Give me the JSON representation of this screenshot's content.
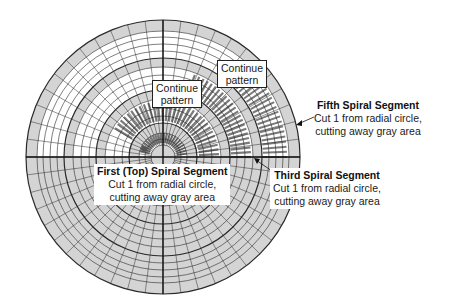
{
  "figure": {
    "type": "spiral-segment cutting layout on radial circle grid",
    "colors": {
      "gray_area": "#d4d4d4",
      "grid_line": "#2a2a2a",
      "strip_mark": "#7a7a7a",
      "background": "#ffffff"
    }
  },
  "callouts": [
    {
      "id": "continue-1",
      "text_line1": "Continue",
      "text_line2": "pattern"
    },
    {
      "id": "continue-2",
      "text_line1": "Continue",
      "text_line2": "pattern"
    }
  ],
  "labels": {
    "fifth": {
      "title": "Fifth Spiral Segment",
      "line1": "Cut 1 from radial circle,",
      "line2": "cutting away gray area"
    },
    "first": {
      "title": "First (Top) Spiral Segment",
      "line1": "Cut 1 from radial circle,",
      "line2": "cutting away gray area"
    },
    "third": {
      "title": "Third Spiral Segment",
      "line1": "Cut 1 from radial circle,",
      "line2": "cutting away gray area"
    }
  }
}
